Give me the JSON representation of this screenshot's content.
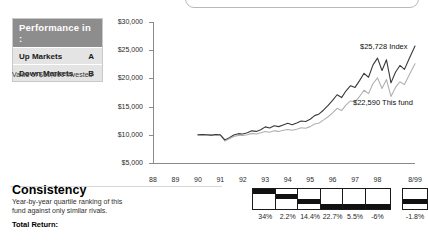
{
  "performance_box": {
    "header": "Performance in :",
    "rows": [
      {
        "label": "Up Markets",
        "grade": "A"
      },
      {
        "label": "Down Markets",
        "grade": "B"
      }
    ],
    "note": "Value of $10,000 invested"
  },
  "consistency": {
    "title": "Consistency",
    "subtitle": "Year-by-year quartile ranking of this fund against only similar rivals.",
    "total_return_label": "Total Return:"
  },
  "annotations": {
    "index": "$25,728 Index",
    "fund": "$22,590 This fund"
  },
  "colors": {
    "index_line": "#3a3a3a",
    "fund_line": "#b0b0b0",
    "header_bg": "#8d8d8d",
    "row_bg": "#e4e4e4",
    "axis": "#8a8a8a",
    "quartile_fill": "#111111"
  },
  "chart_data": {
    "type": "line",
    "title": "",
    "subtitle": "",
    "xlabel": "",
    "ylabel": "",
    "ylim": [
      5000,
      30000
    ],
    "ytick_values": [
      30000,
      25000,
      20000,
      15000,
      10000,
      5000
    ],
    "ytick_labels": [
      "$30,000",
      "$25,000",
      "$20,000",
      "$15,000",
      "$10,000",
      "$5,000"
    ],
    "xtick_labels": [
      "88",
      "89",
      "90",
      "91",
      "92",
      "93",
      "94",
      "95",
      "96",
      "97",
      "98",
      "8/99"
    ],
    "x_start_year": 88,
    "x_end_year": 99.67,
    "grid": false,
    "legend": "annotated-inline",
    "series": [
      {
        "name": "Index",
        "final_value": 25728,
        "color": "#3a3a3a",
        "x": [
          90.0,
          90.2,
          90.4,
          90.6,
          90.8,
          91.0,
          91.2,
          91.4,
          91.6,
          91.8,
          92.0,
          92.2,
          92.4,
          92.6,
          92.8,
          93.0,
          93.2,
          93.4,
          93.6,
          93.8,
          94.0,
          94.2,
          94.4,
          94.6,
          94.8,
          95.0,
          95.2,
          95.4,
          95.6,
          95.8,
          96.0,
          96.2,
          96.4,
          96.6,
          96.8,
          97.0,
          97.2,
          97.4,
          97.6,
          97.8,
          98.0,
          98.2,
          98.4,
          98.6,
          98.8,
          99.0,
          99.2,
          99.4,
          99.67
        ],
        "values": [
          10000,
          10050,
          10000,
          9950,
          10050,
          10000,
          9100,
          9500,
          9950,
          10200,
          10150,
          10350,
          10700,
          10600,
          10900,
          11400,
          11200,
          11600,
          11450,
          11750,
          12050,
          11800,
          12100,
          12450,
          12350,
          12750,
          13400,
          13700,
          14400,
          15200,
          16100,
          17100,
          16600,
          17800,
          18700,
          18400,
          19600,
          20900,
          20200,
          22400,
          23600,
          21400,
          23300,
          19200,
          21100,
          22300,
          21600,
          23400,
          25728
        ]
      },
      {
        "name": "This fund",
        "final_value": 22590,
        "color": "#b0b0b0",
        "x": [
          90.0,
          90.2,
          90.4,
          90.6,
          90.8,
          91.0,
          91.2,
          91.4,
          91.6,
          91.8,
          92.0,
          92.2,
          92.4,
          92.6,
          92.8,
          93.0,
          93.2,
          93.4,
          93.6,
          93.8,
          94.0,
          94.2,
          94.4,
          94.6,
          94.8,
          95.0,
          95.2,
          95.4,
          95.6,
          95.8,
          96.0,
          96.2,
          96.4,
          96.6,
          96.8,
          97.0,
          97.2,
          97.4,
          97.6,
          97.8,
          98.0,
          98.2,
          98.4,
          98.6,
          98.8,
          99.0,
          99.2,
          99.4,
          99.67
        ],
        "values": [
          9950,
          9980,
          9940,
          9900,
          9960,
          9930,
          8900,
          9300,
          9700,
          9900,
          9880,
          10000,
          10250,
          10150,
          10350,
          10600,
          10450,
          10700,
          10600,
          10800,
          10950,
          10800,
          11000,
          11250,
          11150,
          11450,
          11900,
          12100,
          12650,
          13200,
          13900,
          14700,
          14300,
          15300,
          16000,
          15800,
          16800,
          17900,
          17300,
          19100,
          20100,
          18200,
          19800,
          16800,
          18400,
          19400,
          18900,
          20500,
          22590
        ]
      }
    ],
    "quartile_ranking": {
      "years": [
        "93",
        "94",
        "95",
        "96",
        "97",
        "98",
        "8/99"
      ],
      "quartiles": [
        1,
        2,
        3,
        4,
        4,
        4,
        3
      ],
      "returns": [
        "34%",
        "2.2%",
        "14.4%",
        "22.7%",
        "5.5%",
        "-6%",
        "-1.8%"
      ]
    }
  }
}
